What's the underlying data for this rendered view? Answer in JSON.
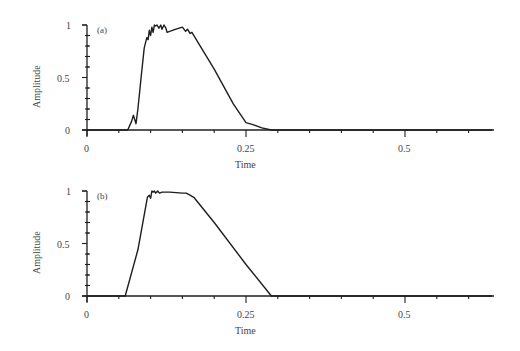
{
  "chart_data": [
    {
      "type": "line",
      "panel_label": "(a)",
      "xlabel": "Time",
      "ylabel": "Amplitude",
      "xlim": [
        0,
        0.64
      ],
      "ylim": [
        0,
        1
      ],
      "x_ticks": [
        "0",
        "0.25",
        "0.5"
      ],
      "y_ticks": [
        "0",
        "0.5",
        "1"
      ],
      "x_minor_step": 0.05,
      "y_minor_step": 0.1,
      "grid": false,
      "series": [
        {
          "name": "a",
          "x": [
            0,
            0.064,
            0.07,
            0.073,
            0.077,
            0.08,
            0.085,
            0.09,
            0.094,
            0.096,
            0.098,
            0.1,
            0.102,
            0.104,
            0.106,
            0.108,
            0.11,
            0.113,
            0.116,
            0.118,
            0.121,
            0.124,
            0.126,
            0.13,
            0.14,
            0.15,
            0.155,
            0.158,
            0.162,
            0.165,
            0.17,
            0.2,
            0.23,
            0.25,
            0.262,
            0.275,
            0.29,
            0.64
          ],
          "y": [
            0,
            0,
            0.08,
            0.14,
            0.06,
            0.2,
            0.5,
            0.78,
            0.88,
            0.86,
            0.95,
            0.9,
            0.98,
            0.93,
            1.0,
            0.99,
            1.0,
            0.97,
            1.0,
            0.96,
            1.0,
            0.97,
            0.93,
            0.94,
            0.96,
            0.98,
            0.94,
            0.96,
            0.92,
            0.93,
            0.88,
            0.58,
            0.25,
            0.07,
            0.05,
            0.02,
            0,
            0
          ]
        }
      ]
    },
    {
      "type": "line",
      "panel_label": "(b)",
      "xlabel": "Time",
      "ylabel": "Amplitude",
      "xlim": [
        0,
        0.64
      ],
      "ylim": [
        0,
        1
      ],
      "x_ticks": [
        "0",
        "0.25",
        "0.5"
      ],
      "y_ticks": [
        "0",
        "0.5",
        "1"
      ],
      "x_minor_step": 0.05,
      "y_minor_step": 0.1,
      "grid": false,
      "series": [
        {
          "name": "b",
          "x": [
            0,
            0.06,
            0.08,
            0.095,
            0.098,
            0.1,
            0.102,
            0.104,
            0.106,
            0.108,
            0.111,
            0.114,
            0.118,
            0.13,
            0.15,
            0.156,
            0.162,
            0.168,
            0.2,
            0.25,
            0.29,
            0.64
          ],
          "y": [
            0,
            0,
            0.44,
            0.94,
            0.96,
            0.93,
            1.0,
            0.99,
            1.0,
            0.98,
            1.0,
            0.98,
            0.99,
            0.99,
            0.98,
            0.98,
            0.96,
            0.94,
            0.7,
            0.3,
            0,
            0
          ]
        }
      ]
    }
  ],
  "panels": [
    {
      "label": "(a)",
      "xlabel": "Time",
      "ylabel": "Amplitude",
      "x_tick_labels": [
        "0",
        "0.25",
        "0.5"
      ],
      "y_tick_labels": [
        "0",
        "0.5",
        "1"
      ]
    },
    {
      "label": "(b)",
      "xlabel": "Time",
      "ylabel": "Amplitude",
      "x_tick_labels": [
        "0",
        "0.25",
        "0.5"
      ],
      "y_tick_labels": [
        "0",
        "0.5",
        "1"
      ]
    }
  ]
}
